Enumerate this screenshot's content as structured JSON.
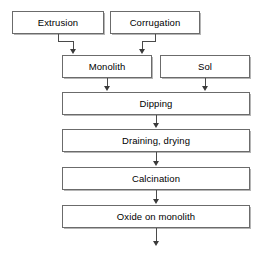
{
  "diagram": {
    "background_color": "#ffffff",
    "line_color": "#4a4a4a",
    "box_border_color": "#6b6b6b",
    "box_fill_color": "#ffffff",
    "text_color": "#000000",
    "nodes": [
      {
        "id": "extrusion",
        "label": "Extrusion",
        "x": 12,
        "y": 11,
        "w": 92,
        "h": 23
      },
      {
        "id": "corrugation",
        "label": "Corrugation",
        "x": 110,
        "y": 11,
        "w": 90,
        "h": 23
      },
      {
        "id": "monolith",
        "label": "Monolith",
        "x": 62,
        "y": 55,
        "w": 90,
        "h": 23
      },
      {
        "id": "sol",
        "label": "Sol",
        "x": 160,
        "y": 55,
        "w": 90,
        "h": 23
      },
      {
        "id": "dipping",
        "label": "Dipping",
        "x": 62,
        "y": 92,
        "w": 188,
        "h": 23
      },
      {
        "id": "draining",
        "label": "Draining, drying",
        "x": 62,
        "y": 129,
        "w": 188,
        "h": 23
      },
      {
        "id": "calcination",
        "label": "Calcination",
        "x": 62,
        "y": 167,
        "w": 188,
        "h": 23
      },
      {
        "id": "oxide",
        "label": "Oxide on monolith",
        "x": 62,
        "y": 205,
        "w": 188,
        "h": 23
      }
    ],
    "edges": [
      {
        "id": "extrusion-to-monolith",
        "from": "extrusion",
        "to": "monolith"
      },
      {
        "id": "corrugation-to-monolith",
        "from": "corrugation",
        "to": "monolith"
      },
      {
        "id": "monolith-to-dipping",
        "from": "monolith",
        "to": "dipping"
      },
      {
        "id": "sol-to-dipping",
        "from": "sol",
        "to": "dipping"
      },
      {
        "id": "dipping-to-draining",
        "from": "dipping",
        "to": "draining"
      },
      {
        "id": "draining-to-calcination",
        "from": "draining",
        "to": "calcination"
      },
      {
        "id": "calcination-to-oxide",
        "from": "calcination",
        "to": "oxide"
      },
      {
        "id": "oxide-to-output",
        "from": "oxide",
        "to": ""
      }
    ]
  }
}
